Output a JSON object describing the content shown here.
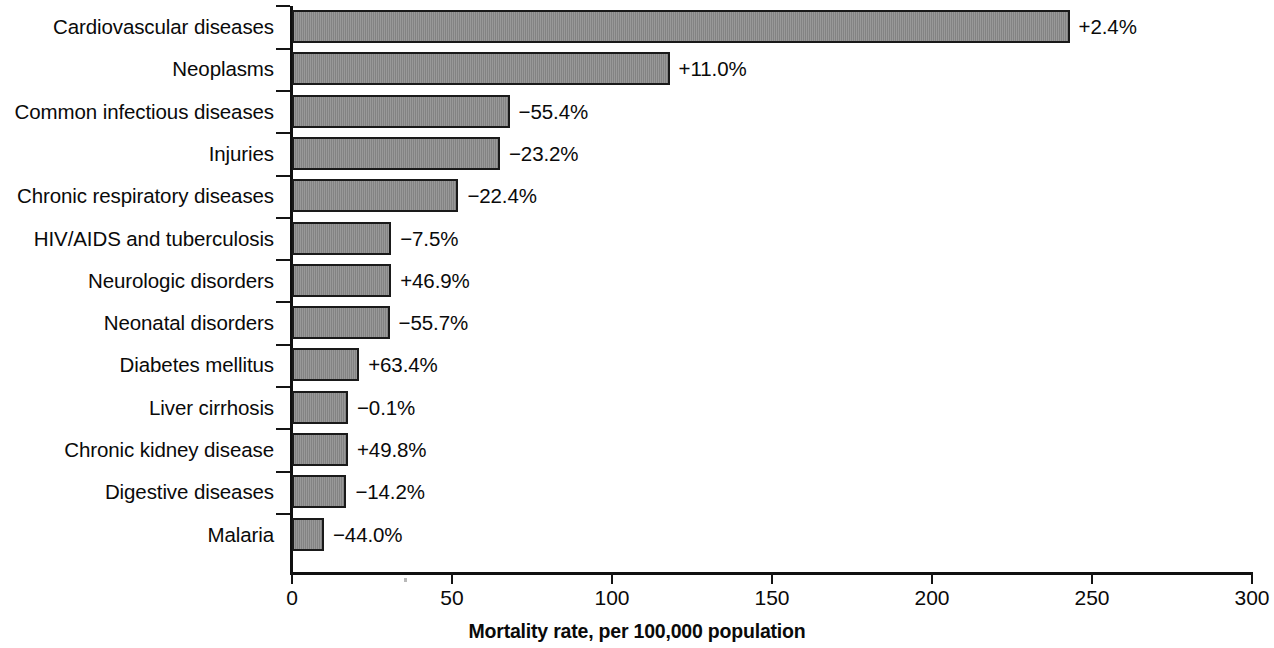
{
  "chart_data": {
    "type": "bar",
    "orientation": "horizontal",
    "title": "",
    "subtitle": "",
    "xlabel": "Mortality rate, per 100,000 population",
    "ylabel": "",
    "xlim": [
      0,
      300
    ],
    "ylim": null,
    "grid": false,
    "legend": null,
    "x_ticks": [
      0,
      50,
      100,
      150,
      200,
      250,
      300
    ],
    "x_tick_labels": [
      "0",
      "50",
      "100",
      "150",
      "200",
      "250",
      "300"
    ],
    "categories": [
      "Cardiovascular diseases",
      "Neoplasms",
      "Common infectious diseases",
      "Injuries",
      "Chronic respiratory diseases",
      "HIV/AIDS and tuberculosis",
      "Neurologic disorders",
      "Neonatal disorders",
      "Diabetes mellitus",
      "Liver cirrhosis",
      "Chronic kidney disease",
      "Digestive diseases",
      "Malaria"
    ],
    "values": [
      243,
      118,
      68,
      65,
      52,
      31,
      31,
      30.5,
      21,
      17.5,
      17.5,
      17,
      10
    ],
    "data_labels": [
      "+2.4%",
      "+11.0%",
      "−55.4%",
      "−23.2%",
      "−22.4%",
      "−7.5%",
      "+46.9%",
      "−55.7%",
      "+63.4%",
      "−0.1%",
      "+49.8%",
      "−14.2%",
      "−44.0%"
    ],
    "percent_change": [
      2.4,
      11.0,
      -55.4,
      -23.2,
      -22.4,
      -7.5,
      46.9,
      -55.7,
      63.4,
      -0.1,
      49.8,
      -14.2,
      -44.0
    ],
    "bar_fill_color": "#8b8b8b",
    "bar_edge_color": "#1a1a1a",
    "axis_color": "#101010",
    "text_color": "#0a0a0a"
  }
}
